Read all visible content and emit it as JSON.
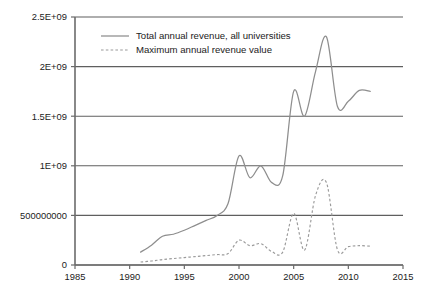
{
  "chart_data": {
    "type": "line",
    "title": "",
    "xlabel": "",
    "ylabel": "",
    "xlim": [
      1985,
      2015
    ],
    "ylim": [
      0,
      2500000000
    ],
    "grid": true,
    "legend_position": "top-left-inside",
    "x_ticks": [
      "1985",
      "1990",
      "1995",
      "2000",
      "2005",
      "2010",
      "2015"
    ],
    "x_tick_values": [
      1985,
      1990,
      1995,
      2000,
      2005,
      2010,
      2015
    ],
    "y_ticks": [
      "0",
      "500000000",
      "1E+09",
      "1.5E+09",
      "2E+09",
      "2.5E+09"
    ],
    "y_tick_values": [
      0,
      500000000,
      1000000000,
      1500000000,
      2000000000,
      2500000000
    ],
    "series": [
      {
        "name": "Total annual revenue, all universities",
        "style": "solid",
        "color": "#8e8e8e",
        "x": [
          1991,
          1992,
          1993,
          1994,
          1995,
          1996,
          1997,
          1998,
          1999,
          2000,
          2001,
          2002,
          2003,
          2004,
          2005,
          2006,
          2007,
          2008,
          2009,
          2010,
          2011,
          2012
        ],
        "values": [
          130000000,
          200000000,
          290000000,
          310000000,
          350000000,
          400000000,
          450000000,
          500000000,
          620000000,
          1100000000,
          880000000,
          1000000000,
          830000000,
          900000000,
          1750000000,
          1500000000,
          1950000000,
          2300000000,
          1600000000,
          1650000000,
          1760000000,
          1750000000
        ]
      },
      {
        "name": "Maximum annual revenue value",
        "style": "dashed",
        "color": "#9a9a9a",
        "x": [
          1991,
          1992,
          1993,
          1994,
          1995,
          1996,
          1997,
          1998,
          1999,
          2000,
          2001,
          2002,
          2003,
          2004,
          2005,
          2006,
          2007,
          2008,
          2009,
          2010,
          2011,
          2012
        ],
        "values": [
          30000000,
          40000000,
          55000000,
          65000000,
          75000000,
          85000000,
          95000000,
          105000000,
          115000000,
          250000000,
          195000000,
          215000000,
          135000000,
          130000000,
          520000000,
          150000000,
          700000000,
          830000000,
          155000000,
          185000000,
          195000000,
          190000000
        ]
      }
    ],
    "legend_entries": [
      "Total annual revenue, all universities",
      "Maximum annual revenue value"
    ]
  },
  "geometry": {
    "plot_left": 75,
    "plot_right": 403,
    "plot_top": 17,
    "plot_bottom": 265,
    "legend_x_swatch_start": 101,
    "legend_x_swatch_end": 129,
    "legend_x_text": 136,
    "legend_y_first": 36,
    "legend_y_step": 14
  }
}
